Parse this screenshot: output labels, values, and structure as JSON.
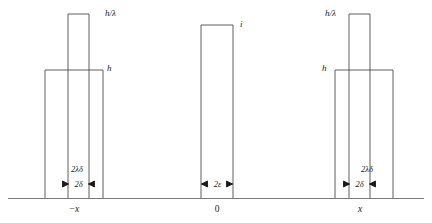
{
  "figure": {
    "type": "line-diagram",
    "stroke_color": "#4d4d4d",
    "axis_color": "#6b6b6b",
    "text_color": "#1a1a1a",
    "background": "#ffffff"
  },
  "axis": {
    "ticks": [
      {
        "label": "−x",
        "position": "left"
      },
      {
        "label": "0",
        "position": "center"
      },
      {
        "label": "x",
        "position": "right"
      }
    ]
  },
  "groups": [
    {
      "name": "left-group",
      "tick_label": "−x",
      "bars": [
        {
          "name": "wide-bar",
          "height_label": "h",
          "width_label": "2λδ",
          "label_side": "right"
        },
        {
          "name": "narrow-bar",
          "height_label": "h/λ",
          "width_label": "2δ",
          "label_side": "right"
        }
      ],
      "dimensions": [
        {
          "name": "outer-width",
          "label": "2λδ"
        },
        {
          "name": "inner-width",
          "label": "2δ"
        }
      ]
    },
    {
      "name": "center-group",
      "tick_label": "0",
      "bars": [
        {
          "name": "center-bar",
          "height_label": "i",
          "width_label": "2ε",
          "label_side": "right"
        }
      ],
      "dimensions": [
        {
          "name": "center-width",
          "label": "2ε"
        }
      ]
    },
    {
      "name": "right-group",
      "tick_label": "x",
      "bars": [
        {
          "name": "wide-bar",
          "height_label": "h",
          "width_label": "2λδ",
          "label_side": "left"
        },
        {
          "name": "narrow-bar",
          "height_label": "h/λ",
          "width_label": "2δ",
          "label_side": "left"
        }
      ],
      "dimensions": [
        {
          "name": "outer-width",
          "label": "2λδ"
        },
        {
          "name": "inner-width",
          "label": "2δ"
        }
      ]
    }
  ],
  "labels": {
    "h_over_lambda_left": "h/λ",
    "h_left": "h",
    "i_center": "i",
    "h_over_lambda_right": "h/λ",
    "h_right": "h",
    "two_lambda_delta_left": "2λδ",
    "two_delta_left": "2δ",
    "two_epsilon": "2ε",
    "two_lambda_delta_right": "2λδ",
    "two_delta_right": "2δ",
    "tick_minus_x": "−x",
    "tick_zero": "0",
    "tick_x": "x"
  }
}
